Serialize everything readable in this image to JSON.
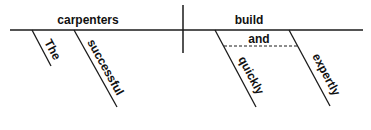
{
  "diagram": {
    "type": "reed-kellogg-sentence-diagram",
    "subject": "carpenters",
    "predicate": "build",
    "subject_modifiers": [
      "The",
      "successful"
    ],
    "predicate_modifiers": [
      "quickly",
      "expertly"
    ],
    "conjunction": "and"
  },
  "colors": {
    "line": "#1a1a1a",
    "background": "#ffffff"
  }
}
